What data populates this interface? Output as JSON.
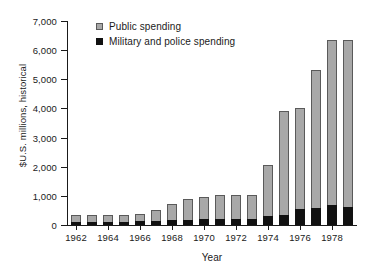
{
  "chart_data": {
    "type": "bar",
    "stacked": true,
    "title": "",
    "xlabel": "Year",
    "ylabel": "$U.S. millions, historical",
    "ylim": [
      0,
      7000
    ],
    "ytick_step": 1000,
    "ytick_labels": [
      "0",
      "1,000",
      "2,000",
      "3,000",
      "4,000",
      "5,000",
      "6,000",
      "7,000"
    ],
    "ytick_values": [
      0,
      1000,
      2000,
      3000,
      4000,
      5000,
      6000,
      7000
    ],
    "grid": false,
    "legend_position": "top-left",
    "categories": [
      1962,
      1963,
      1964,
      1965,
      1966,
      1967,
      1968,
      1969,
      1970,
      1971,
      1972,
      1973,
      1974,
      1975,
      1976,
      1977,
      1978,
      1979
    ],
    "xtick_labels": [
      "1962",
      "1964",
      "1966",
      "1968",
      "1970",
      "1972",
      "1974",
      "1976",
      "1978"
    ],
    "xtick_values": [
      1962,
      1964,
      1966,
      1968,
      1970,
      1972,
      1974,
      1976,
      1978
    ],
    "series": [
      {
        "name": "Military and police spending",
        "color": "#111111",
        "values": [
          110,
          110,
          120,
          120,
          130,
          140,
          170,
          180,
          190,
          200,
          210,
          215,
          300,
          330,
          550,
          570,
          680,
          620
        ]
      },
      {
        "name": "Public spending",
        "color": "#a8a8a8",
        "values": [
          220,
          220,
          230,
          240,
          250,
          380,
          560,
          710,
          770,
          840,
          820,
          830,
          1750,
          3570,
          3480,
          4750,
          5670,
          5730
        ]
      }
    ],
    "totals": [
      330,
      330,
      350,
      360,
      380,
      520,
      730,
      890,
      960,
      1040,
      1030,
      1045,
      2050,
      3900,
      4030,
      5320,
      6350,
      6350
    ]
  },
  "legend": {
    "items": [
      {
        "label": "Public spending",
        "swatch": "gray-square-icon"
      },
      {
        "label": "Military and police spending",
        "swatch": "black-square-icon"
      }
    ]
  }
}
